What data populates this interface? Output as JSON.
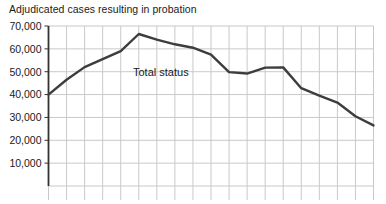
{
  "chart_data": {
    "type": "line",
    "title": "Adjudicated cases resulting in probation",
    "xlabel": "",
    "ylabel": "",
    "ylim": [
      0,
      70000
    ],
    "yticks": [
      70000,
      60000,
      50000,
      40000,
      30000,
      20000,
      10000
    ],
    "ytick_labels": [
      "70,000",
      "60,000",
      "50,000",
      "40,000",
      "30,000",
      "20,000",
      "10,000"
    ],
    "grid": true,
    "grid_columns": 18,
    "x_tick_labels": [],
    "legend_position": "inline-annotation",
    "series": [
      {
        "name": "Total status",
        "annotation": "Total status",
        "color": "#3d3d3d",
        "x": [
          0,
          1,
          2,
          3,
          4,
          5,
          6,
          7,
          8,
          9,
          10,
          11,
          12,
          13,
          14,
          15,
          16,
          17,
          18
        ],
        "values": [
          40000,
          46500,
          52000,
          55500,
          59000,
          66500,
          64000,
          62000,
          60500,
          57500,
          49800,
          49200,
          51800,
          51900,
          42800,
          39500,
          36500,
          30500,
          26500
        ]
      }
    ]
  },
  "axis": {
    "y_axis_color": "#333333",
    "grid_color": "#c9c9c9"
  }
}
